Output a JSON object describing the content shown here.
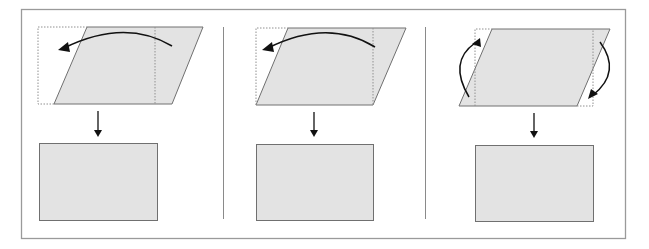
{
  "figure": {
    "colors": {
      "frame": "#9a9a9a",
      "divider": "#8a8a8a",
      "shape_fill": "#e3e3e3",
      "shape_stroke": "#707070",
      "dotted": "#909090",
      "arrow": "#111111"
    },
    "panels": [
      {
        "id": "panel-1",
        "parallelogram": [
          [
            87,
            27
          ],
          [
            203,
            27
          ],
          [
            172,
            104
          ],
          [
            54,
            104
          ]
        ],
        "dotted_rect": {
          "x": 38,
          "y": 27,
          "x2": 87
        },
        "dotted_line_x": 155,
        "curved_arrows": [
          {
            "path": "M172,46 Q125,18 64,48",
            "head": [
              [
                58,
                50
              ],
              [
                68,
                42
              ],
              [
                70,
                52
              ]
            ]
          }
        ],
        "down_arrow": {
          "x": 98,
          "y1": 111,
          "y2": 137
        },
        "result_rect": {
          "x": 39,
          "y": 143,
          "w": 118,
          "h": 77
        }
      },
      {
        "id": "panel-2",
        "parallelogram": [
          [
            288,
            28
          ],
          [
            406,
            28
          ],
          [
            373,
            105
          ],
          [
            256,
            105
          ]
        ],
        "dotted_rect": {
          "x": 256,
          "y": 28,
          "x2": 288
        },
        "dotted_line_x": 373,
        "curved_arrows": [
          {
            "path": "M375,47 Q328,18 268,48",
            "head": [
              [
                262,
                50
              ],
              [
                272,
                42
              ],
              [
                274,
                52
              ]
            ]
          }
        ],
        "down_arrow": {
          "x": 314,
          "y1": 112,
          "y2": 137
        },
        "result_rect": {
          "x": 256,
          "y": 144,
          "w": 117,
          "h": 76
        }
      },
      {
        "id": "panel-3",
        "parallelogram": [
          [
            492,
            29
          ],
          [
            610,
            29
          ],
          [
            577,
            106
          ],
          [
            459,
            106
          ]
        ],
        "dotted_left_x": 475,
        "dotted_right_x": 593,
        "curved_arrows": [
          {
            "path": "M469,97 Q448,62 475,43",
            "head": [
              [
                480,
                38
              ],
              [
                472,
                44
              ],
              [
                481,
                47
              ]
            ]
          },
          {
            "path": "M600,42 Q622,72 593,95",
            "head": [
              [
                588,
                99
              ],
              [
                591,
                89
              ],
              [
                598,
                94
              ]
            ]
          }
        ],
        "down_arrow": {
          "x": 534,
          "y1": 113,
          "y2": 138
        },
        "result_rect": {
          "x": 475,
          "y": 145,
          "w": 118,
          "h": 76
        }
      }
    ],
    "frame": {
      "x": 21,
      "y": 9,
      "w": 604,
      "h": 229
    },
    "dividers": [
      {
        "x": 223,
        "y1": 27,
        "y2": 219
      },
      {
        "x": 425,
        "y1": 27,
        "y2": 219
      }
    ]
  }
}
